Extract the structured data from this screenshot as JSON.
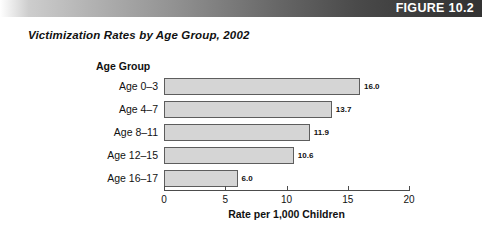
{
  "header": {
    "figure_word": "FIGURE",
    "figure_number": "10.2",
    "bar_color_left": "#cdcdcd",
    "bar_color_right": "#333333",
    "text_color": "#ffffff"
  },
  "figure": {
    "title": "Victimization Rates by Age Group, 2002"
  },
  "chart_data": {
    "type": "bar",
    "orientation": "horizontal",
    "title": "Victimization Rates by Age Group, 2002",
    "group_axis_title": "Age Group",
    "xlabel": "Rate per 1,000 Children",
    "ylabel": "Age Group",
    "categories": [
      "Age 0–3",
      "Age 4–7",
      "Age 8–11",
      "Age 12–15",
      "Age 16–17"
    ],
    "values": [
      16.0,
      13.7,
      11.9,
      10.6,
      6.0
    ],
    "value_labels": [
      "16.0",
      "13.7",
      "11.9",
      "10.6",
      "6.0"
    ],
    "xlim": [
      0,
      20
    ],
    "xticks": [
      0,
      5,
      10,
      15,
      20
    ],
    "xtick_labels": [
      "0",
      "5",
      "10",
      "15",
      "20"
    ],
    "grid": false,
    "legend": false,
    "bar_fill_color": "#d5d5d5",
    "bar_border_color": "#5d5d5d"
  }
}
